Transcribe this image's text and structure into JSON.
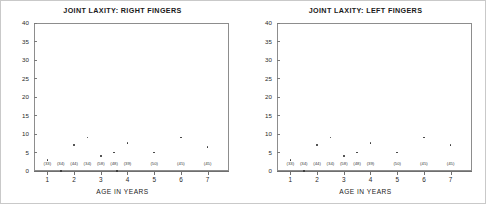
{
  "figure": {
    "axis_title": "AGE IN YEARS",
    "y_ticks": [
      "40",
      "35",
      "30",
      "25",
      "20",
      "15",
      "10",
      "5",
      "0"
    ],
    "x_ticks": [
      "1",
      "2",
      "3",
      "4",
      "5",
      "6",
      "7"
    ],
    "counts": [
      "(33)",
      "(34)",
      "(44)",
      "(34)",
      "(58)",
      "(48)",
      "(39)",
      "(50)",
      "(45)",
      "(45)"
    ],
    "ink_color": "#333333",
    "frame_color": "#8d8d8d"
  },
  "panels": [
    {
      "title": "JOINT LAXITY: RIGHT FINGERS"
    },
    {
      "title": "JOINT LAXITY: LEFT FINGERS"
    }
  ],
  "chart_data": [
    {
      "type": "scatter",
      "title": "JOINT LAXITY: RIGHT FINGERS",
      "xlabel": "AGE IN YEARS",
      "ylabel": "",
      "xlim": [
        0.5,
        7.8
      ],
      "ylim": [
        0,
        40
      ],
      "ytick_values": [
        0,
        5,
        10,
        15,
        20,
        25,
        30,
        35,
        40
      ],
      "xtick_values": [
        1,
        2,
        3,
        4,
        5,
        6,
        7
      ],
      "grid": false,
      "legend": "none",
      "x": [
        1.0,
        1.5,
        2.0,
        2.5,
        3.0,
        3.5,
        3.6,
        4.0,
        5.0,
        6.0,
        7.0
      ],
      "y": [
        3.0,
        0.0,
        7.0,
        9.0,
        4.0,
        5.0,
        0.0,
        7.5,
        5.0,
        9.0,
        6.5
      ],
      "group_counts": [
        {
          "label": "(33)",
          "x": 1.0
        },
        {
          "label": "(34)",
          "x": 1.5
        },
        {
          "label": "(44)",
          "x": 2.0
        },
        {
          "label": "(34)",
          "x": 2.5
        },
        {
          "label": "(58)",
          "x": 3.0
        },
        {
          "label": "(48)",
          "x": 3.5
        },
        {
          "label": "(39)",
          "x": 4.0
        },
        {
          "label": "(50)",
          "x": 5.0
        },
        {
          "label": "(45)",
          "x": 6.0
        },
        {
          "label": "(45)",
          "x": 7.0
        }
      ]
    },
    {
      "type": "scatter",
      "title": "JOINT LAXITY: LEFT FINGERS",
      "xlabel": "AGE IN YEARS",
      "ylabel": "",
      "xlim": [
        0.5,
        7.8
      ],
      "ylim": [
        0,
        40
      ],
      "ytick_values": [
        0,
        5,
        10,
        15,
        20,
        25,
        30,
        35,
        40
      ],
      "xtick_values": [
        1,
        2,
        3,
        4,
        5,
        6,
        7
      ],
      "grid": false,
      "legend": "none",
      "x": [
        1.0,
        1.5,
        2.0,
        2.5,
        3.0,
        3.5,
        4.0,
        5.0,
        6.0,
        7.0
      ],
      "y": [
        3.0,
        0.0,
        7.0,
        9.0,
        4.0,
        5.0,
        7.5,
        5.0,
        9.0,
        7.0
      ],
      "group_counts": [
        {
          "label": "(33)",
          "x": 1.0
        },
        {
          "label": "(34)",
          "x": 1.5
        },
        {
          "label": "(44)",
          "x": 2.0
        },
        {
          "label": "(34)",
          "x": 2.5
        },
        {
          "label": "(58)",
          "x": 3.0
        },
        {
          "label": "(48)",
          "x": 3.5
        },
        {
          "label": "(39)",
          "x": 4.0
        },
        {
          "label": "(50)",
          "x": 5.0
        },
        {
          "label": "(45)",
          "x": 6.0
        },
        {
          "label": "(45)",
          "x": 7.0
        }
      ]
    }
  ]
}
